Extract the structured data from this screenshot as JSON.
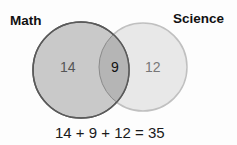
{
  "diagram": {
    "type": "venn",
    "sets": [
      {
        "label": "Math",
        "only_count": "14",
        "fill": "#c9c9c9",
        "stroke": "#5a5a5a"
      },
      {
        "label": "Science",
        "only_count": "12",
        "fill": "#e8e8e8",
        "stroke": "#c0c0c0"
      }
    ],
    "intersection": {
      "count": "9",
      "fill": "#b5b5b5"
    },
    "equation": "14 + 9 + 12 = 35"
  }
}
